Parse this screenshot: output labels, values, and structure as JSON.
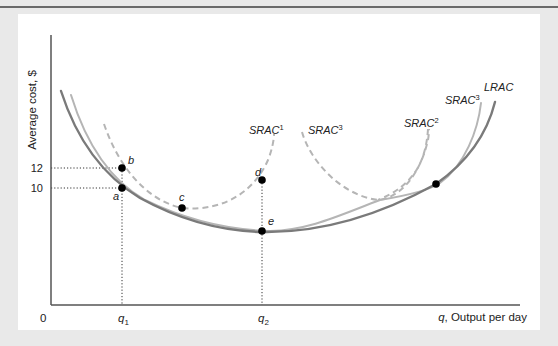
{
  "chart_data": {
    "type": "line",
    "title": "",
    "xlabel": "q, Output per day",
    "ylabel": "Average cost, $",
    "origin_label": "0",
    "x_ticks": [
      {
        "label": "q",
        "sub": "1",
        "px": 122
      },
      {
        "label": "q",
        "sub": "2",
        "px": 262
      }
    ],
    "y_ticks": [
      {
        "label": "12",
        "py": 168
      },
      {
        "label": "10",
        "py": 188
      }
    ],
    "grid": false,
    "legend": "none (curves labeled inline)",
    "series": [
      {
        "name": "LRAC",
        "style": "solid-dark",
        "color": "#7a7a7a",
        "path": "M61,91 C80,150 110,180 140,198 C180,220 220,231 262,232 C320,233 380,215 436,184 C470,160 488,130 495,102"
      },
      {
        "name": "SRAC3",
        "sup": "3",
        "style": "solid-light",
        "color": "#b5b5b5",
        "path": "M71,95 C88,150 115,183 145,200 C190,222 230,230 270,231 C310,230 340,215 380,200 C410,195 430,190 440,183 C465,165 478,130 481,103"
      },
      {
        "name": "SRAC1",
        "sup": "1",
        "style": "dashed",
        "color": "#b5b5b5",
        "path": "M104,124 C118,165 145,200 182,208 C225,212 255,190 268,160 C272,150 274,140 274,134"
      },
      {
        "name": "SRAC3",
        "sup": "3",
        "style": "dashed",
        "color": "#b5b5b5",
        "path": "M302,132 C310,160 340,195 378,200 C400,198 420,175 428,140 C429,134 429,130 429,129"
      },
      {
        "name": "SRAC2",
        "sup": "2",
        "style": "dashed",
        "color": "#b5b5b5",
        "path": "M428,129 C426,160 415,185 378,200"
      }
    ],
    "series_labels": [
      {
        "text": "SRAC",
        "sup": "1",
        "x": 249,
        "y": 134
      },
      {
        "text": "SRAC",
        "sup": "3",
        "x": 308,
        "y": 134
      },
      {
        "text": "SRAC",
        "sup": "2",
        "x": 404,
        "y": 127
      },
      {
        "text": "SRAC",
        "sup": "3",
        "x": 445,
        "y": 104
      },
      {
        "text": "LRAC",
        "sup": "",
        "x": 484,
        "y": 91
      }
    ],
    "points": [
      {
        "label": "a",
        "x": 122,
        "y": 188,
        "lx": 113,
        "ly": 200
      },
      {
        "label": "b",
        "x": 122,
        "y": 168,
        "lx": 128,
        "ly": 164
      },
      {
        "label": "c",
        "x": 182,
        "y": 208,
        "lx": 179,
        "ly": 201
      },
      {
        "label": "d",
        "x": 262,
        "y": 180,
        "lx": 255,
        "ly": 176
      },
      {
        "label": "e",
        "x": 262,
        "y": 231,
        "lx": 268,
        "ly": 225
      },
      {
        "label": "",
        "x": 436,
        "y": 184,
        "lx": 0,
        "ly": 0
      }
    ],
    "values": {
      "a": {
        "q": "q1",
        "cost": 10
      },
      "b": {
        "q": "q1",
        "cost": 12
      },
      "d": {
        "q": "q2"
      },
      "e": {
        "q": "q2"
      }
    },
    "axis": {
      "x0": 51,
      "y0": 305,
      "x_end": 520,
      "y_top": 35
    }
  }
}
